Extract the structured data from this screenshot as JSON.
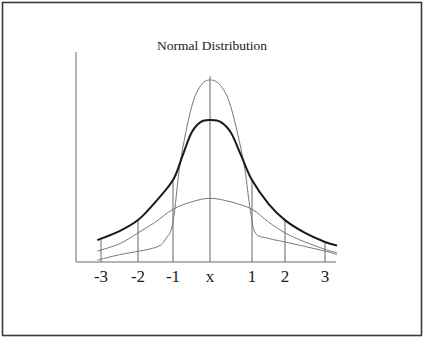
{
  "chart_data": {
    "type": "line",
    "title": "Normal Distribution",
    "xlabel": "",
    "ylabel": "",
    "xlim": [
      -3.6,
      3.3
    ],
    "ylim": [
      0,
      1
    ],
    "grid": false,
    "legend": null,
    "tick_labels": [
      "-3",
      "-2",
      "-1",
      "x",
      "1",
      "2",
      "3"
    ],
    "tick_values": [
      -3,
      -2,
      -1,
      0,
      1,
      2,
      3
    ],
    "series": [
      {
        "name": "narrow-tall",
        "style": "thin",
        "points": [
          [
            -3.1,
            0.01
          ],
          [
            -2.5,
            0.04
          ],
          [
            -1.5,
            0.08
          ],
          [
            -1.2,
            0.13
          ],
          [
            -1.0,
            0.22
          ],
          [
            -0.8,
            0.55
          ],
          [
            -0.5,
            0.85
          ],
          [
            -0.25,
            0.97
          ],
          [
            0,
            1.0
          ],
          [
            0.25,
            0.97
          ],
          [
            0.5,
            0.85
          ],
          [
            0.8,
            0.55
          ],
          [
            0.95,
            0.3
          ],
          [
            1.1,
            0.16
          ],
          [
            1.5,
            0.13
          ],
          [
            2.0,
            0.11
          ],
          [
            3.0,
            0.06
          ],
          [
            3.3,
            0.04
          ]
        ]
      },
      {
        "name": "standard",
        "style": "bold",
        "points": [
          [
            -3.1,
            0.12
          ],
          [
            -2.5,
            0.17
          ],
          [
            -2.0,
            0.23
          ],
          [
            -1.5,
            0.33
          ],
          [
            -1.0,
            0.45
          ],
          [
            -0.75,
            0.58
          ],
          [
            -0.5,
            0.71
          ],
          [
            -0.25,
            0.77
          ],
          [
            0,
            0.78
          ],
          [
            0.25,
            0.77
          ],
          [
            0.5,
            0.71
          ],
          [
            0.75,
            0.58
          ],
          [
            1.0,
            0.45
          ],
          [
            1.5,
            0.32
          ],
          [
            2.0,
            0.23
          ],
          [
            2.5,
            0.16
          ],
          [
            3.0,
            0.11
          ],
          [
            3.3,
            0.09
          ]
        ]
      },
      {
        "name": "wide-flat",
        "style": "thin",
        "points": [
          [
            -3.1,
            0.06
          ],
          [
            -2.5,
            0.1
          ],
          [
            -2.0,
            0.16
          ],
          [
            -1.5,
            0.22
          ],
          [
            -1.0,
            0.29
          ],
          [
            -0.5,
            0.33
          ],
          [
            0,
            0.35
          ],
          [
            0.5,
            0.33
          ],
          [
            1.0,
            0.29
          ],
          [
            1.5,
            0.22
          ],
          [
            2.0,
            0.16
          ],
          [
            2.5,
            0.11
          ],
          [
            3.0,
            0.07
          ],
          [
            3.3,
            0.05
          ]
        ]
      }
    ]
  }
}
